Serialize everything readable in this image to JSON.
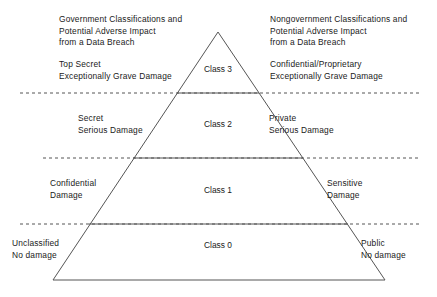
{
  "diagram": {
    "type": "pyramid-classification",
    "title_left": "Government Classifications and Potential Adverse Impact from a Data Breach",
    "title_right": "Nongovernment Classifications and Potential Adverse Impact from a Data Breach",
    "header_left": {
      "line1": "Government Classifications and",
      "line2": "Potential Adverse Impact",
      "line3": "from a Data Breach"
    },
    "header_right": {
      "line1": "Nongovernment Classifications and",
      "line2": "Potential Adverse Impact",
      "line3": "from a Data Breach"
    },
    "tiers": [
      {
        "class_label": "Class 3",
        "gov_name": "Top Secret",
        "gov_impact": "Exceptionally Grave Damage",
        "nongov_name": "Confidential/Proprietary",
        "nongov_impact": "Exceptionally Grave Damage"
      },
      {
        "class_label": "Class 2",
        "gov_name": "Secret",
        "gov_impact": "Serious Damage",
        "nongov_name": "Private",
        "nongov_impact": "Serious Damage"
      },
      {
        "class_label": "Class 1",
        "gov_name": "Confidential",
        "gov_impact": "Damage",
        "nongov_name": "Sensitive",
        "nongov_impact": "Damage"
      },
      {
        "class_label": "Class 0",
        "gov_name": "Unclassified",
        "gov_impact": "No damage",
        "nongov_name": "Public",
        "nongov_impact": "No damage"
      }
    ],
    "colors": {
      "outline": "#555555",
      "dashed_rule": "#555555",
      "text": "#1a1a1a",
      "background": "#ffffff"
    }
  }
}
